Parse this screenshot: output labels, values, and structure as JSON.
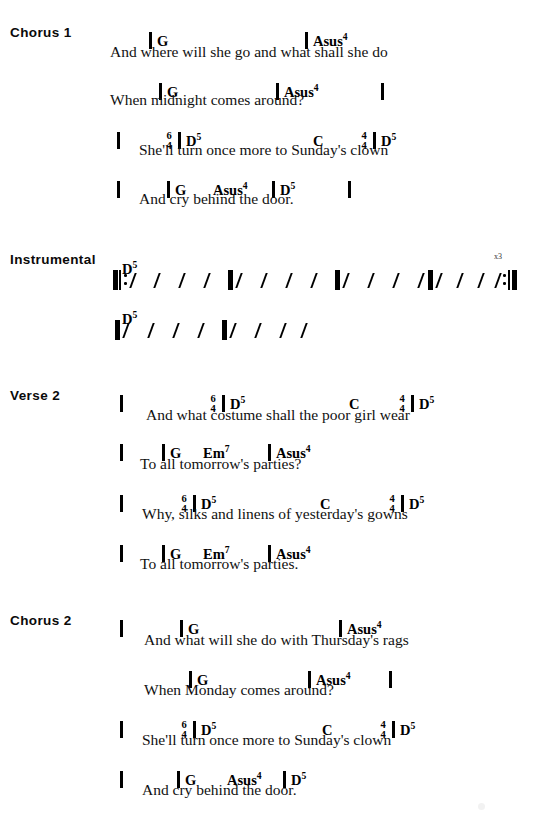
{
  "page": {
    "width": 542,
    "height": 823,
    "background": "#ffffff",
    "ink": "#000000"
  },
  "sections": [
    {
      "id": "chorus-1",
      "label": "Chorus 1",
      "label_x": 10,
      "label_y": 25,
      "chord_rows": [
        {
          "y": 22,
          "items": [
            {
              "kind": "barline",
              "x": 149
            },
            {
              "kind": "chord",
              "x": 157,
              "text": "G"
            },
            {
              "kind": "barline",
              "x": 305
            },
            {
              "kind": "chord",
              "x": 313,
              "text": "Asus",
              "sup": "4"
            }
          ]
        },
        {
          "y": 73,
          "items": [
            {
              "kind": "barline",
              "x": 159
            },
            {
              "kind": "chord",
              "x": 167,
              "text": "G"
            },
            {
              "kind": "barline",
              "x": 276
            },
            {
              "kind": "chord",
              "x": 284,
              "text": "Asus",
              "sup": "4"
            },
            {
              "kind": "barline",
              "x": 381
            }
          ]
        },
        {
          "y": 122,
          "items": [
            {
              "kind": "barline",
              "x": 117
            },
            {
              "kind": "timesig",
              "x": 163,
              "top": "6",
              "bottom": "4"
            },
            {
              "kind": "barline",
              "x": 178
            },
            {
              "kind": "chord",
              "x": 186,
              "text": "D",
              "sup": "5"
            },
            {
              "kind": "chord",
              "x": 313,
              "text": "C"
            },
            {
              "kind": "timesig",
              "x": 358,
              "top": "4",
              "bottom": "4"
            },
            {
              "kind": "barline",
              "x": 373
            },
            {
              "kind": "chord",
              "x": 381,
              "text": "D",
              "sup": "5"
            }
          ]
        },
        {
          "y": 171,
          "items": [
            {
              "kind": "barline",
              "x": 117
            },
            {
              "kind": "barline",
              "x": 167
            },
            {
              "kind": "chord",
              "x": 175,
              "text": "G"
            },
            {
              "kind": "chord",
              "x": 213,
              "text": "Asus",
              "sup": "4"
            },
            {
              "kind": "barline",
              "x": 272
            },
            {
              "kind": "chord",
              "x": 280,
              "text": "D",
              "sup": "5"
            },
            {
              "kind": "barline",
              "x": 348
            }
          ]
        }
      ],
      "lyrics": [
        {
          "x": 110,
          "y": 43,
          "text": "And where will she go and what shall she do"
        },
        {
          "x": 110,
          "y": 91,
          "text": "When midnight comes around?"
        },
        {
          "x": 139,
          "y": 141,
          "text": "She'll turn once more to  Sunday's clown"
        },
        {
          "x": 139,
          "y": 190,
          "text": "And cry behind the door."
        }
      ]
    },
    {
      "id": "instrumental",
      "label": "Instrumental",
      "label_x": 10,
      "label_y": 252,
      "chord_rows": [
        {
          "y": 250,
          "items": [
            {
              "kind": "chord",
              "x": 122,
              "text": "D",
              "sup": "5"
            }
          ]
        },
        {
          "y": 300,
          "items": [
            {
              "kind": "chord",
              "x": 122,
              "text": "D",
              "sup": "5"
            }
          ]
        }
      ],
      "lyrics": [],
      "rhythm_rows": [
        {
          "y": 266,
          "times_label": "x3",
          "times_label_x": 494,
          "times_label_y": 252,
          "items": [
            {
              "kind": "thickbar",
              "x": 113
            },
            {
              "kind": "thinbar",
              "x": 119
            },
            {
              "kind": "repeat-dots",
              "x": 124
            },
            {
              "kind": "slash",
              "x": 132
            },
            {
              "kind": "slash",
              "x": 156
            },
            {
              "kind": "slash",
              "x": 181
            },
            {
              "kind": "slash",
              "x": 206
            },
            {
              "kind": "thickbar",
              "x": 228
            },
            {
              "kind": "slash",
              "x": 238
            },
            {
              "kind": "slash",
              "x": 263
            },
            {
              "kind": "slash",
              "x": 288
            },
            {
              "kind": "slash",
              "x": 313
            },
            {
              "kind": "thickbar",
              "x": 335
            },
            {
              "kind": "slash",
              "x": 345
            },
            {
              "kind": "slash",
              "x": 370
            },
            {
              "kind": "slash",
              "x": 395
            },
            {
              "kind": "slash",
              "x": 420
            },
            {
              "kind": "thickbar",
              "x": 428
            },
            {
              "kind": "slash",
              "x": 438
            },
            {
              "kind": "slash",
              "x": 459
            },
            {
              "kind": "slash",
              "x": 480
            },
            {
              "kind": "slash",
              "x": 497
            },
            {
              "kind": "repeat-dots",
              "x": 503
            },
            {
              "kind": "thinbar",
              "x": 508
            },
            {
              "kind": "thickbar",
              "x": 512
            }
          ]
        },
        {
          "y": 316,
          "items": [
            {
              "kind": "thickbar",
              "x": 115
            },
            {
              "kind": "slash",
              "x": 125
            },
            {
              "kind": "slash",
              "x": 150
            },
            {
              "kind": "slash",
              "x": 175
            },
            {
              "kind": "slash",
              "x": 200
            },
            {
              "kind": "thickbar",
              "x": 222
            },
            {
              "kind": "slash",
              "x": 232
            },
            {
              "kind": "slash",
              "x": 257
            },
            {
              "kind": "slash",
              "x": 282
            },
            {
              "kind": "slash",
              "x": 303
            }
          ]
        }
      ]
    },
    {
      "id": "verse-2",
      "label": "Verse 2",
      "label_x": 10,
      "label_y": 388,
      "chord_rows": [
        {
          "y": 385,
          "items": [
            {
              "kind": "barline",
              "x": 120
            },
            {
              "kind": "timesig",
              "x": 207,
              "top": "6",
              "bottom": "4"
            },
            {
              "kind": "barline",
              "x": 222
            },
            {
              "kind": "chord",
              "x": 230,
              "text": "D",
              "sup": "5"
            },
            {
              "kind": "chord",
              "x": 349,
              "text": "C"
            },
            {
              "kind": "timesig",
              "x": 396,
              "top": "4",
              "bottom": "4"
            },
            {
              "kind": "barline",
              "x": 411
            },
            {
              "kind": "chord",
              "x": 419,
              "text": "D",
              "sup": "5"
            }
          ]
        },
        {
          "y": 434,
          "items": [
            {
              "kind": "barline",
              "x": 120
            },
            {
              "kind": "barline",
              "x": 162
            },
            {
              "kind": "chord",
              "x": 170,
              "text": "G"
            },
            {
              "kind": "chord",
              "x": 203,
              "text": "Em",
              "sup": "7"
            },
            {
              "kind": "barline",
              "x": 268
            },
            {
              "kind": "chord",
              "x": 276,
              "text": "Asus",
              "sup": "4"
            }
          ]
        },
        {
          "y": 485,
          "items": [
            {
              "kind": "barline",
              "x": 120
            },
            {
              "kind": "timesig",
              "x": 178,
              "top": "6",
              "bottom": "4"
            },
            {
              "kind": "barline",
              "x": 193
            },
            {
              "kind": "chord",
              "x": 201,
              "text": "D",
              "sup": "5"
            },
            {
              "kind": "chord",
              "x": 320,
              "text": "C"
            },
            {
              "kind": "timesig",
              "x": 386,
              "top": "4",
              "bottom": "4"
            },
            {
              "kind": "barline",
              "x": 401
            },
            {
              "kind": "chord",
              "x": 409,
              "text": "D",
              "sup": "5"
            }
          ]
        },
        {
          "y": 535,
          "items": [
            {
              "kind": "barline",
              "x": 120
            },
            {
              "kind": "barline",
              "x": 162
            },
            {
              "kind": "chord",
              "x": 170,
              "text": "G"
            },
            {
              "kind": "chord",
              "x": 203,
              "text": "Em",
              "sup": "7"
            },
            {
              "kind": "barline",
              "x": 268
            },
            {
              "kind": "chord",
              "x": 276,
              "text": "Asus",
              "sup": "4"
            }
          ]
        }
      ],
      "lyrics": [
        {
          "x": 146,
          "y": 406,
          "text": "And what costume shall the poor girl wear"
        },
        {
          "x": 140,
          "y": 455,
          "text": "To all tomorrow's parties?"
        },
        {
          "x": 142,
          "y": 505,
          "text": "Why,  silks and linens of yesterday's gowns"
        },
        {
          "x": 140,
          "y": 555,
          "text": "To all tomorrow's parties."
        }
      ]
    },
    {
      "id": "chorus-2",
      "label": "Chorus 2",
      "label_x": 10,
      "label_y": 613,
      "chord_rows": [
        {
          "y": 610,
          "items": [
            {
              "kind": "barline",
              "x": 120
            },
            {
              "kind": "barline",
              "x": 180
            },
            {
              "kind": "chord",
              "x": 188,
              "text": "G"
            },
            {
              "kind": "barline",
              "x": 339
            },
            {
              "kind": "chord",
              "x": 347,
              "text": "Asus",
              "sup": "4"
            }
          ]
        },
        {
          "y": 661,
          "items": [
            {
              "kind": "barline",
              "x": 189
            },
            {
              "kind": "chord",
              "x": 197,
              "text": "G"
            },
            {
              "kind": "barline",
              "x": 308
            },
            {
              "kind": "chord",
              "x": 316,
              "text": "Asus",
              "sup": "4"
            },
            {
              "kind": "barline",
              "x": 389
            }
          ]
        },
        {
          "y": 711,
          "items": [
            {
              "kind": "barline",
              "x": 120
            },
            {
              "kind": "timesig",
              "x": 178,
              "top": "6",
              "bottom": "4"
            },
            {
              "kind": "barline",
              "x": 193
            },
            {
              "kind": "chord",
              "x": 201,
              "text": "D",
              "sup": "5"
            },
            {
              "kind": "chord",
              "x": 322,
              "text": "C"
            },
            {
              "kind": "timesig",
              "x": 377,
              "top": "4",
              "bottom": "4"
            },
            {
              "kind": "barline",
              "x": 392
            },
            {
              "kind": "chord",
              "x": 400,
              "text": "D",
              "sup": "5"
            }
          ]
        },
        {
          "y": 761,
          "items": [
            {
              "kind": "barline",
              "x": 120
            },
            {
              "kind": "barline",
              "x": 177
            },
            {
              "kind": "chord",
              "x": 185,
              "text": "G"
            },
            {
              "kind": "chord",
              "x": 227,
              "text": "Asus",
              "sup": "4"
            },
            {
              "kind": "barline",
              "x": 283
            },
            {
              "kind": "chord",
              "x": 291,
              "text": "D",
              "sup": "5"
            }
          ]
        }
      ],
      "lyrics": [
        {
          "x": 144,
          "y": 631,
          "text": "And what will she do with Thursday's rags"
        },
        {
          "x": 144,
          "y": 681,
          "text": "When Monday comes around?"
        },
        {
          "x": 142,
          "y": 731,
          "text": "She'll turn once more to Sunday's clown"
        },
        {
          "x": 142,
          "y": 781,
          "text": "And cry behind the door."
        }
      ]
    }
  ]
}
